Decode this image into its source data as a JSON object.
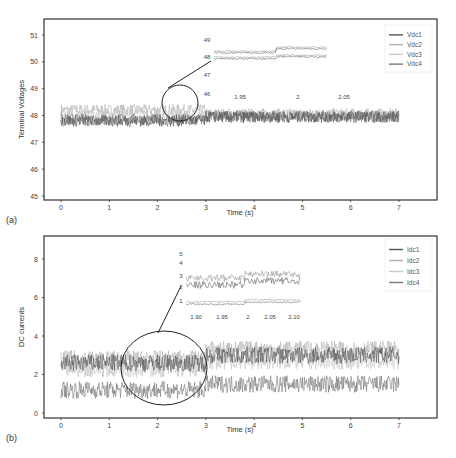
{
  "chart_data": [
    {
      "panel_label": "(a)",
      "type": "line",
      "title": "",
      "xlabel": "Time (s)",
      "ylabel": "Terminal Voltages",
      "xlim": [
        0,
        7
      ],
      "ylim": [
        45,
        51
      ],
      "xticks": [
        "0",
        "1",
        "2",
        "3",
        "4",
        "5",
        "6",
        "7"
      ],
      "yticks": [
        "45",
        "46",
        "47",
        "48",
        "49",
        "50",
        "51"
      ],
      "grid": false,
      "legend_position": "upper right",
      "x": [
        0,
        1,
        2,
        3,
        4,
        5,
        6,
        7
      ],
      "series": [
        {
          "name": "Vdc1",
          "color": "#555555",
          "values": [
            47.8,
            47.8,
            47.8,
            47.95,
            47.95,
            47.95,
            47.95,
            47.95
          ]
        },
        {
          "name": "Vdc2",
          "color": "#b0b0b0",
          "values": [
            48.2,
            48.2,
            48.2,
            48.05,
            48.05,
            48.05,
            48.05,
            48.05
          ]
        },
        {
          "name": "Vdc3",
          "color": "#c8c8c8",
          "values": [
            48.0,
            48.0,
            48.0,
            48.0,
            48.0,
            48.0,
            48.0,
            48.0
          ]
        },
        {
          "name": "Vdc4",
          "color": "#777777",
          "values": [
            47.85,
            47.85,
            47.85,
            47.95,
            47.95,
            47.95,
            47.95,
            47.95
          ]
        }
      ],
      "annotations": {
        "zoom_circle_center_x": 2.0,
        "zoom_circle_center_y": 48.0,
        "inset_yticks": [
          "49",
          "48",
          "47",
          "46"
        ],
        "inset_xticks": [
          "1.95",
          "2",
          "2.05"
        ]
      }
    },
    {
      "panel_label": "(b)",
      "type": "line",
      "title": "",
      "xlabel": "Time (s)",
      "ylabel": "DC currents",
      "xlim": [
        0,
        7
      ],
      "ylim": [
        0,
        9
      ],
      "xticks": [
        "0",
        "1",
        "2",
        "3",
        "4",
        "5",
        "6",
        "7"
      ],
      "yticks": [
        "0",
        "2",
        "4",
        "6",
        "8"
      ],
      "grid": false,
      "legend_position": "upper right",
      "x": [
        0,
        1,
        2,
        3,
        4,
        5,
        6,
        7
      ],
      "series": [
        {
          "name": "Idc1",
          "color": "#555555",
          "values": [
            2.6,
            2.6,
            2.6,
            3.0,
            3.0,
            3.0,
            3.0,
            3.0
          ]
        },
        {
          "name": "Idc2",
          "color": "#b0b0b0",
          "values": [
            2.8,
            2.8,
            2.8,
            3.3,
            3.3,
            3.3,
            3.3,
            3.3
          ]
        },
        {
          "name": "Idc3",
          "color": "#c8c8c8",
          "values": [
            2.3,
            2.3,
            2.3,
            2.7,
            2.7,
            2.7,
            2.7,
            2.7
          ]
        },
        {
          "name": "Idc4",
          "color": "#777777",
          "values": [
            1.2,
            1.2,
            1.2,
            1.5,
            1.5,
            1.5,
            1.5,
            1.5
          ]
        }
      ],
      "annotations": {
        "zoom_circle_center_x": 2.0,
        "zoom_circle_center_y": 2.3,
        "inset_yticks": [
          "5",
          "4",
          "3",
          "2",
          "1"
        ],
        "inset_xticks": [
          "1.90",
          "1.95",
          "2",
          "2.05",
          "2.10"
        ]
      }
    }
  ],
  "figure": {
    "panel_a_label": "(a)",
    "panel_b_label": "(b)",
    "xlabel": "Time (s)",
    "ylabel_a": "Terminal Voltages",
    "ylabel_b": "DC currents"
  }
}
